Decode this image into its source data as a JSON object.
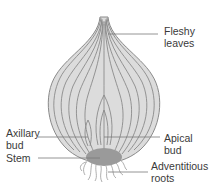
{
  "diagram": {
    "labels": {
      "fleshy_leaves": [
        "Fleshy",
        "leaves"
      ],
      "axillary_bud": [
        "Axillary",
        "bud"
      ],
      "apical_bud": [
        "Apical",
        "bud"
      ],
      "stem": [
        "Stem"
      ],
      "adventitious_roots": [
        "Adventitious",
        "roots"
      ]
    },
    "colors": {
      "bulb_fill": "#dcdcdc",
      "leaf_lines": "#8a8a8a",
      "stem_fill": "#9a9a9a",
      "leader_lines": "#7a7a7a",
      "text": "#3a3a3a"
    }
  }
}
